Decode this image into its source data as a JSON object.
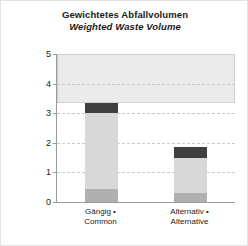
{
  "chart_data": {
    "type": "bar",
    "title": "Gewichtetes Abfallvolumen",
    "subtitle": "Weighted Waste Volume",
    "xlabel": "",
    "ylabel": "Bewertung • Rating",
    "ylim": [
      0,
      5
    ],
    "yticks": [
      "0",
      "1",
      "2",
      "3",
      "4",
      "5"
    ],
    "grid": true,
    "legend": "none",
    "stacked": true,
    "categories": [
      "Gängig • Common",
      "Alternativ • Alternative"
    ],
    "category_lines": [
      [
        "Gängig •",
        "Common"
      ],
      [
        "Alternativ •",
        "Alternative"
      ]
    ],
    "series": [
      {
        "name": "base-segment",
        "values": [
          0.45,
          0.3
        ]
      },
      {
        "name": "light-segment",
        "values": [
          2.55,
          1.2
        ]
      },
      {
        "name": "dark-cap",
        "values": [
          0.35,
          0.35
        ]
      }
    ],
    "totals": [
      3.35,
      1.85
    ],
    "colors": {
      "base": "#b0b0b0",
      "light": "#d8d8d8",
      "cap": "#3f3f3f",
      "band": "#ebebeb",
      "axis": "#9a9a9a",
      "grid": "#c9c9c9",
      "text": "#1a1a1a",
      "background": "#ffffff"
    }
  }
}
